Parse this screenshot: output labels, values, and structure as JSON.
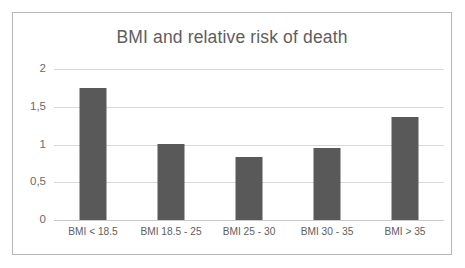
{
  "chart_data": {
    "type": "bar",
    "title": "BMI and relative risk of death",
    "xlabel": "",
    "ylabel": "",
    "categories": [
      "BMI < 18.5",
      "BMI 18.5 - 25",
      "BMI 25 - 30",
      "BMI 30 - 35",
      "BMI > 35"
    ],
    "values": [
      1.75,
      1.01,
      0.84,
      0.95,
      1.36
    ],
    "ylim": [
      0,
      2
    ],
    "ytick_values": [
      0,
      0.5,
      1,
      1.5,
      2
    ],
    "ytick_labels": [
      "0",
      "0,5",
      "1",
      "1,5",
      "2"
    ],
    "decimal_separator": ",",
    "grid": true,
    "legend": false,
    "series_color": "#595959",
    "gridline_color": "#d9d9d9",
    "title_color": "#5e5e5e",
    "label_color": "#5e5e5e",
    "frame_border_color": "#b7b7b7",
    "background_color": "#ffffff"
  }
}
